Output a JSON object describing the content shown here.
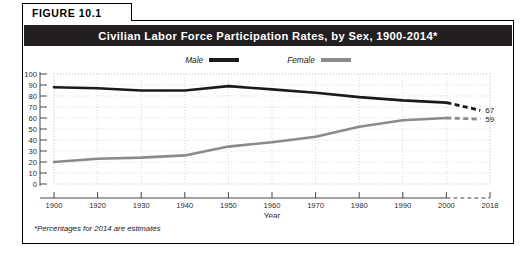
{
  "figure": {
    "tab_label": "FIGURE 10.1",
    "title": "Civilian Labor Force Participation Rates, by Sex, 1900-2014*",
    "footnote": "*Percentages for 2014 are estimates"
  },
  "legend": {
    "position": "top-center",
    "entries": [
      {
        "label": "Male",
        "color": "#1a1a1a"
      },
      {
        "label": "Female",
        "color": "#8a8a8a"
      }
    ]
  },
  "colors": {
    "title_bar_bg": "#231f20",
    "title_bar_text": "#ffffff",
    "frame_border": "#000000",
    "male_line": "#1a1a1a",
    "female_line": "#8a8a8a",
    "grid": "#c9c9c9",
    "plot_bg": "#ffffff"
  },
  "chart_data": {
    "type": "line",
    "title": "Civilian Labor Force Participation Rates, by Sex, 1900-2014*",
    "xlabel": "Year",
    "ylabel": "",
    "ylim": [
      0,
      100
    ],
    "ytick_step": 10,
    "yticks": [
      0,
      10,
      20,
      30,
      40,
      50,
      60,
      70,
      80,
      90,
      100
    ],
    "xticks": [
      "1900",
      "1920",
      "1930",
      "1940",
      "1950",
      "1960",
      "1970",
      "1980",
      "1990",
      "2000",
      "2018"
    ],
    "xlim": [
      1900,
      2018
    ],
    "grid": true,
    "grid_style": "dotted",
    "projection_starts_at": 2000,
    "projection_style": "dashed",
    "series": [
      {
        "name": "Male",
        "color": "#1a1a1a",
        "end_label": "67",
        "x": [
          1900,
          1920,
          1930,
          1940,
          1950,
          1960,
          1970,
          1980,
          1990,
          2000,
          2014
        ],
        "values": [
          88,
          87,
          85,
          85,
          89,
          86,
          83,
          79,
          76,
          74,
          67
        ]
      },
      {
        "name": "Female",
        "color": "#8a8a8a",
        "end_label": "59",
        "x": [
          1900,
          1920,
          1930,
          1940,
          1950,
          1960,
          1970,
          1980,
          1990,
          2000,
          2014
        ],
        "values": [
          20,
          23,
          24,
          26,
          34,
          38,
          43,
          52,
          58,
          60,
          59
        ]
      }
    ]
  }
}
